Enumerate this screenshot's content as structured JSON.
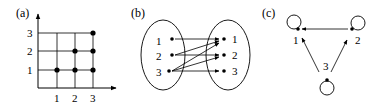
{
  "panels": {
    "a": {
      "label": "(a)",
      "x_ticks": [
        "1",
        "2",
        "3"
      ],
      "y_ticks": [
        "1",
        "2",
        "3"
      ],
      "points": [
        [
          1,
          1
        ],
        [
          2,
          1
        ],
        [
          3,
          1
        ],
        [
          2,
          2
        ],
        [
          3,
          2
        ],
        [
          3,
          3
        ]
      ]
    },
    "b": {
      "label": "(b)",
      "left_set": [
        "1",
        "2",
        "3"
      ],
      "right_set": [
        "1",
        "2",
        "3"
      ],
      "arrows": [
        [
          1,
          1
        ],
        [
          2,
          1
        ],
        [
          2,
          2
        ],
        [
          3,
          1
        ],
        [
          3,
          2
        ],
        [
          3,
          3
        ]
      ]
    },
    "c": {
      "label": "(c)",
      "nodes": [
        "1",
        "2",
        "3"
      ],
      "edges": [
        [
          2,
          1
        ],
        [
          3,
          1
        ],
        [
          3,
          2
        ]
      ],
      "self_loops": [
        1,
        2,
        3
      ]
    }
  },
  "colors": {
    "ink": "#000000",
    "background": "#ffffff"
  }
}
